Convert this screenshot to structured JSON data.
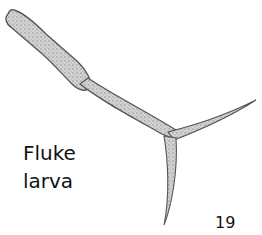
{
  "figure": {
    "label_lines": [
      "Fluke",
      "larva"
    ],
    "number": "19",
    "colors": {
      "background": "#ffffff",
      "body_fill": "#c8c8c8",
      "outline": "#555555",
      "text": "#111111"
    }
  }
}
